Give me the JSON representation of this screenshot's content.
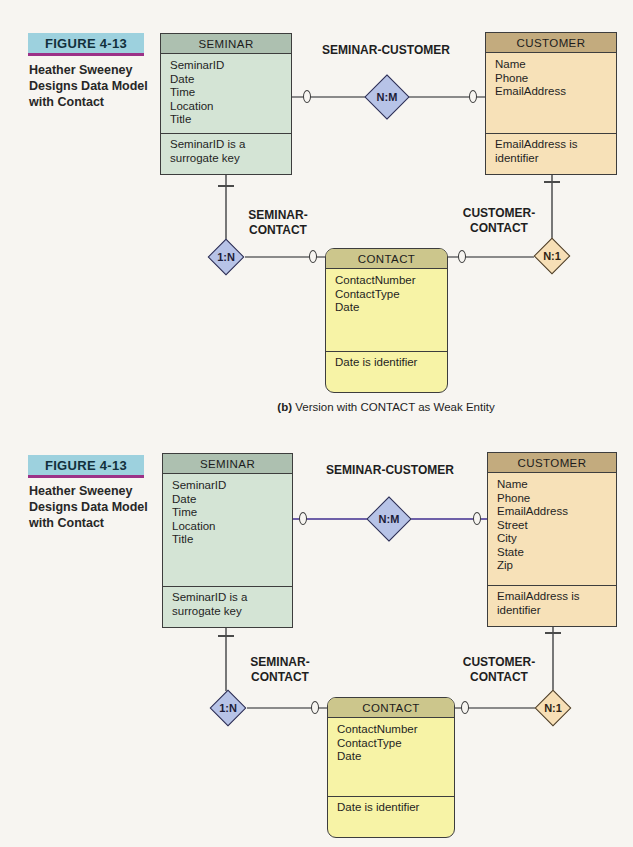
{
  "colors": {
    "page_bg": "#f7f5f1",
    "figure_badge_bg": "#9dd1de",
    "figure_badge_underline": "#9c3187",
    "seminar_header": "#adc0b0",
    "seminar_body": "#d4e4d5",
    "customer_header": "#c3ab7e",
    "customer_body": "#f7e1b8",
    "contact_header": "#ccc68c",
    "contact_body": "#f7f3a6",
    "relationship_diamond_blue": "#b7c3e7",
    "relationship_diamond_tan": "#f7dfb6",
    "connector_gray": "#8a8a8a",
    "connector_purple": "#6e60a8"
  },
  "diagrams": [
    {
      "figure_label": "FIGURE 4-13",
      "figure_caption_lines": [
        "Heather Sweeney",
        "Designs Data Model",
        "with Contact"
      ],
      "entities": {
        "seminar": {
          "title": "SEMINAR",
          "attributes": [
            "SeminarID",
            "Date",
            "Time",
            "Location",
            "Title"
          ],
          "note": "SeminarID is a surrogate key"
        },
        "customer": {
          "title": "CUSTOMER",
          "attributes": [
            "Name",
            "Phone",
            "EmailAddress"
          ],
          "note": "EmailAddress is identifier"
        },
        "contact": {
          "title": "CONTACT",
          "attributes": [
            "ContactNumber",
            "ContactType",
            "Date"
          ],
          "note": "Date is identifier"
        }
      },
      "relationships": {
        "seminar_customer": {
          "label": "SEMINAR-CUSTOMER",
          "cardinality": "N:M"
        },
        "seminar_contact": {
          "label_lines": [
            "SEMINAR-",
            "CONTACT"
          ],
          "cardinality": "1:N"
        },
        "customer_contact": {
          "label_lines": [
            "CUSTOMER-",
            "CONTACT"
          ],
          "cardinality": "N:1"
        }
      },
      "caption": {
        "bold": "(b)",
        "text": " Version with CONTACT as Weak Entity"
      }
    },
    {
      "figure_label": "FIGURE 4-13",
      "figure_caption_lines": [
        "Heather Sweeney",
        "Designs Data Model",
        "with Contact"
      ],
      "entities": {
        "seminar": {
          "title": "SEMINAR",
          "attributes": [
            "SeminarID",
            "Date",
            "Time",
            "Location",
            "Title"
          ],
          "note": "SeminarID is a surrogate key"
        },
        "customer": {
          "title": "CUSTOMER",
          "attributes": [
            "Name",
            "Phone",
            "EmailAddress",
            "Street",
            "City",
            "State",
            "Zip"
          ],
          "note": "EmailAddress is identifier"
        },
        "contact": {
          "title": "CONTACT",
          "attributes": [
            "ContactNumber",
            "ContactType",
            "Date"
          ],
          "note": "Date is identifier"
        }
      },
      "relationships": {
        "seminar_customer": {
          "label": "SEMINAR-CUSTOMER",
          "cardinality": "N:M"
        },
        "seminar_contact": {
          "label_lines": [
            "SEMINAR-",
            "CONTACT"
          ],
          "cardinality": "1:N"
        },
        "customer_contact": {
          "label_lines": [
            "CUSTOMER-",
            "CONTACT"
          ],
          "cardinality": "N:1"
        }
      }
    }
  ]
}
